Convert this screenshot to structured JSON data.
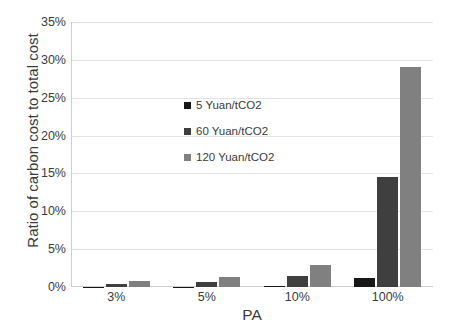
{
  "chart_data": {
    "type": "bar",
    "title": "",
    "xlabel": "PA",
    "ylabel": "Ratio of carbon cost to total cost",
    "categories": [
      "3%",
      "5%",
      "10%",
      "100%"
    ],
    "series": [
      {
        "name": "5 Yuan/tCO2",
        "color": "#171717",
        "values": [
          0.03,
          0.04,
          0.12,
          1.15
        ]
      },
      {
        "name": "60 Yuan/tCO2",
        "color": "#3f3f3f",
        "values": [
          0.42,
          0.6,
          1.4,
          14.5
        ]
      },
      {
        "name": "120 Yuan/tCO2",
        "color": "#808080",
        "values": [
          0.8,
          1.35,
          2.85,
          29.1
        ]
      }
    ],
    "ylim": [
      0,
      35
    ],
    "ytick_values": [
      0,
      5,
      10,
      15,
      20,
      25,
      30,
      35
    ],
    "ytick_labels": [
      "0%",
      "5%",
      "10%",
      "15%",
      "20%",
      "25%",
      "30%",
      "35%"
    ],
    "grid": true,
    "legend_position": "inside-center-upper",
    "axis_color": "#cfcfcf",
    "gridline_color": "#e3e3e3",
    "background": "#ffffff"
  }
}
